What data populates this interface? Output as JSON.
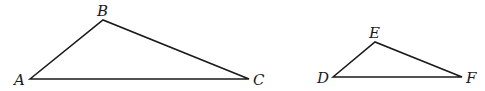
{
  "figure": {
    "colors": {
      "stroke": "#1a1a1a",
      "background": "#ffffff"
    },
    "triangles": [
      {
        "name": "ABC",
        "vertices": [
          {
            "label": "A",
            "x": 30,
            "y": 79,
            "label_x": 14,
            "label_y": 85
          },
          {
            "label": "B",
            "x": 103,
            "y": 20,
            "label_x": 97,
            "label_y": 16
          },
          {
            "label": "C",
            "x": 249,
            "y": 79,
            "label_x": 253,
            "label_y": 85
          }
        ]
      },
      {
        "name": "DEF",
        "vertices": [
          {
            "label": "D",
            "x": 333,
            "y": 77,
            "label_x": 317,
            "label_y": 83
          },
          {
            "label": "E",
            "x": 375,
            "y": 42,
            "label_x": 369,
            "label_y": 38
          },
          {
            "label": "F",
            "x": 462,
            "y": 77,
            "label_x": 466,
            "label_y": 83
          }
        ]
      }
    ]
  }
}
